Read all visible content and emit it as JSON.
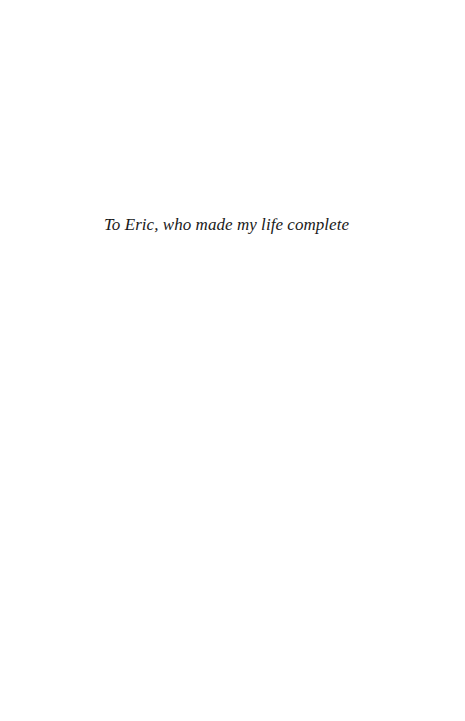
{
  "page": {
    "background": "#ffffff",
    "dedication": "To Eric, who made my life complete"
  }
}
